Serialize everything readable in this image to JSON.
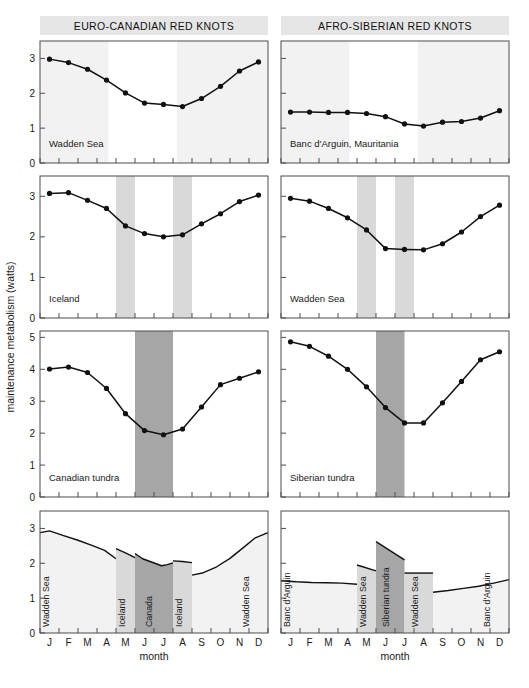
{
  "figure": {
    "y_axis_title": "maintenance metabolism (watts)",
    "x_axis_title": "month",
    "months": [
      "J",
      "F",
      "M",
      "A",
      "M",
      "J",
      "J",
      "A",
      "S",
      "O",
      "N",
      "D"
    ],
    "colors": {
      "header_band": "#e6e6e6",
      "light_band": "#f2f2f2",
      "mid_band": "#d9d9d9",
      "dark_band": "#a6a6a6",
      "line": "#111111",
      "marker": "#111111",
      "axis": "#4d4d4d"
    }
  },
  "columns": [
    {
      "id": "euro-canadian",
      "title": "EURO-CANADIAN RED KNOTS"
    },
    {
      "id": "afro-siberian",
      "title": "AFRO-SIBERIAN RED KNOTS"
    }
  ],
  "chart_data": [
    {
      "id": "wadden-sea-euro",
      "type": "line",
      "column": "euro-canadian",
      "row": 1,
      "title": "Wadden Sea",
      "xlabel": "",
      "ylabel": "maintenance metabolism (watts)",
      "categories": [
        "J",
        "F",
        "M",
        "A",
        "M",
        "J",
        "J",
        "A",
        "S",
        "O",
        "N",
        "D"
      ],
      "values": [
        2.98,
        2.88,
        2.69,
        2.38,
        2.01,
        1.72,
        1.68,
        1.62,
        1.85,
        2.2,
        2.64,
        2.9
      ],
      "ylim": [
        0,
        3.5
      ],
      "yticks": [
        0,
        1,
        2,
        3
      ],
      "grid": false,
      "shaded_regions": [
        {
          "label": "Wadden Sea",
          "from": 1,
          "to": 4.6,
          "shade": "light"
        },
        {
          "label": "Wadden Sea",
          "from": 8.2,
          "to": 13,
          "shade": "light"
        }
      ]
    },
    {
      "id": "banc-darguin",
      "type": "line",
      "column": "afro-siberian",
      "row": 1,
      "title": "Banc d'Arguin, Mauritania",
      "xlabel": "",
      "ylabel": "",
      "categories": [
        "J",
        "F",
        "M",
        "A",
        "M",
        "J",
        "J",
        "A",
        "S",
        "O",
        "N",
        "D"
      ],
      "values": [
        1.46,
        1.46,
        1.45,
        1.45,
        1.42,
        1.33,
        1.12,
        1.06,
        1.17,
        1.19,
        1.29,
        1.5
      ],
      "ylim": [
        0,
        3.5
      ],
      "yticks": [
        0,
        1,
        2,
        3
      ],
      "grid": false,
      "shaded_regions": [
        {
          "label": "Banc d'Arguin",
          "from": 1,
          "to": 4.6,
          "shade": "light"
        },
        {
          "label": "Banc d'Arguin",
          "from": 8.2,
          "to": 13,
          "shade": "light"
        }
      ]
    },
    {
      "id": "iceland",
      "type": "line",
      "column": "euro-canadian",
      "row": 2,
      "title": "Iceland",
      "xlabel": "",
      "ylabel": "maintenance metabolism (watts)",
      "categories": [
        "J",
        "F",
        "M",
        "A",
        "M",
        "J",
        "J",
        "A",
        "S",
        "O",
        "N",
        "D"
      ],
      "values": [
        3.07,
        3.09,
        2.9,
        2.7,
        2.27,
        2.08,
        2.0,
        2.05,
        2.32,
        2.57,
        2.87,
        3.03
      ],
      "ylim": [
        0,
        3.5
      ],
      "yticks": [
        0,
        1,
        2,
        3
      ],
      "grid": false,
      "shaded_regions": [
        {
          "label": "Iceland",
          "from": 5,
          "to": 6,
          "shade": "mid"
        },
        {
          "label": "Iceland",
          "from": 8,
          "to": 9,
          "shade": "mid"
        }
      ]
    },
    {
      "id": "wadden-sea-afro",
      "type": "line",
      "column": "afro-siberian",
      "row": 2,
      "title": "Wadden Sea",
      "xlabel": "",
      "ylabel": "",
      "categories": [
        "J",
        "F",
        "M",
        "A",
        "M",
        "J",
        "J",
        "A",
        "S",
        "O",
        "N",
        "D"
      ],
      "values": [
        2.95,
        2.88,
        2.7,
        2.47,
        2.17,
        1.71,
        1.69,
        1.68,
        1.83,
        2.12,
        2.5,
        2.78
      ],
      "ylim": [
        0,
        3.5
      ],
      "yticks": [
        0,
        1,
        2,
        3
      ],
      "grid": false,
      "shaded_regions": [
        {
          "label": "Wadden Sea",
          "from": 5,
          "to": 6,
          "shade": "mid"
        },
        {
          "label": "Wadden Sea",
          "from": 7,
          "to": 8,
          "shade": "mid"
        }
      ]
    },
    {
      "id": "canadian-tundra",
      "type": "line",
      "column": "euro-canadian",
      "row": 3,
      "title": "Canadian tundra",
      "xlabel": "",
      "ylabel": "maintenance metabolism (watts)",
      "categories": [
        "J",
        "F",
        "M",
        "A",
        "M",
        "J",
        "J",
        "A",
        "S",
        "O",
        "N",
        "D"
      ],
      "values": [
        4.01,
        4.07,
        3.9,
        3.4,
        2.61,
        2.08,
        1.95,
        2.13,
        2.82,
        3.52,
        3.72,
        3.92
      ],
      "ylim": [
        0,
        5.2
      ],
      "yticks": [
        0,
        1,
        2,
        3,
        4,
        5
      ],
      "grid": false,
      "shaded_regions": [
        {
          "label": "Canada",
          "from": 6,
          "to": 8,
          "shade": "dark"
        }
      ]
    },
    {
      "id": "siberian-tundra",
      "type": "line",
      "column": "afro-siberian",
      "row": 3,
      "title": "Siberian tundra",
      "xlabel": "",
      "ylabel": "",
      "categories": [
        "J",
        "F",
        "M",
        "A",
        "M",
        "J",
        "J",
        "A",
        "S",
        "O",
        "N",
        "D"
      ],
      "values": [
        4.86,
        4.72,
        4.41,
        4.0,
        3.45,
        2.8,
        2.32,
        2.32,
        2.95,
        3.62,
        4.3,
        4.55
      ],
      "ylim": [
        0,
        5.2
      ],
      "yticks": [
        0,
        1,
        2,
        3,
        4,
        5
      ],
      "grid": false,
      "shaded_regions": [
        {
          "label": "Siberian tundra",
          "from": 6,
          "to": 7.5,
          "shade": "dark"
        }
      ]
    },
    {
      "id": "euro-canadian-annual",
      "type": "area",
      "column": "euro-canadian",
      "row": 4,
      "title": "",
      "xlabel": "month",
      "ylabel": "maintenance metabolism (watts)",
      "categories": [
        "J",
        "F",
        "M",
        "A",
        "M",
        "J",
        "J",
        "A",
        "S",
        "O",
        "N",
        "D"
      ],
      "ylim": [
        0,
        3.5
      ],
      "yticks": [
        0,
        1,
        2,
        3
      ],
      "grid": false,
      "segments": [
        {
          "label": "Wadden Sea",
          "shade": "light",
          "from": 1.0,
          "to": 5.0,
          "points": [
            [
              1.0,
              2.88
            ],
            [
              1.5,
              2.93
            ],
            [
              2.2,
              2.8
            ],
            [
              3.0,
              2.66
            ],
            [
              3.8,
              2.5
            ],
            [
              4.4,
              2.37
            ],
            [
              5.0,
              2.13
            ]
          ]
        },
        {
          "label": "Iceland",
          "shade": "mid",
          "from": 5.0,
          "to": 6.0,
          "points": [
            [
              5.0,
              2.42
            ],
            [
              5.5,
              2.3
            ],
            [
              6.0,
              2.16
            ]
          ]
        },
        {
          "label": "Canada",
          "shade": "dark",
          "from": 6.0,
          "to": 8.0,
          "points": [
            [
              6.0,
              2.28
            ],
            [
              6.4,
              2.13
            ],
            [
              6.9,
              2.03
            ],
            [
              7.4,
              1.93
            ],
            [
              7.7,
              1.96
            ],
            [
              8.0,
              2.01
            ]
          ]
        },
        {
          "label": "Iceland",
          "shade": "mid",
          "from": 8.0,
          "to": 9.0,
          "points": [
            [
              8.0,
              2.07
            ],
            [
              8.5,
              2.05
            ],
            [
              9.0,
              2.02
            ]
          ]
        },
        {
          "label": "Wadden Sea",
          "shade": "light",
          "from": 9.0,
          "to": 13.0,
          "points": [
            [
              9.0,
              1.66
            ],
            [
              9.6,
              1.73
            ],
            [
              10.3,
              1.9
            ],
            [
              11.0,
              2.14
            ],
            [
              11.7,
              2.45
            ],
            [
              12.3,
              2.72
            ],
            [
              13.0,
              2.88
            ]
          ]
        }
      ],
      "region_labels": [
        {
          "text": "Wadden Sea",
          "at": 1.45
        },
        {
          "text": "Iceland",
          "at": 5.45
        },
        {
          "text": "Canada",
          "at": 6.9
        },
        {
          "text": "Iceland",
          "at": 8.45
        },
        {
          "text": "Wadden Sea",
          "at": 12.0
        }
      ]
    },
    {
      "id": "afro-siberian-annual",
      "type": "area",
      "column": "afro-siberian",
      "row": 4,
      "title": "",
      "xlabel": "month",
      "ylabel": "",
      "categories": [
        "J",
        "F",
        "M",
        "A",
        "M",
        "J",
        "J",
        "A",
        "S",
        "O",
        "N",
        "D"
      ],
      "ylim": [
        0,
        3.5
      ],
      "yticks": [
        0,
        1,
        2,
        3
      ],
      "grid": false,
      "segments": [
        {
          "label": "Banc d'Arguin",
          "shade": "light",
          "from": 1.0,
          "to": 5.0,
          "points": [
            [
              1.0,
              1.5
            ],
            [
              1.8,
              1.47
            ],
            [
              2.6,
              1.45
            ],
            [
              3.4,
              1.44
            ],
            [
              4.2,
              1.43
            ],
            [
              5.0,
              1.4
            ]
          ]
        },
        {
          "label": "Wadden Sea",
          "shade": "mid",
          "from": 5.0,
          "to": 6.0,
          "points": [
            [
              5.0,
              1.95
            ],
            [
              6.0,
              1.78
            ]
          ]
        },
        {
          "label": "Siberian tundra",
          "shade": "dark",
          "from": 6.0,
          "to": 7.5,
          "points": [
            [
              6.0,
              2.62
            ],
            [
              7.5,
              2.1
            ]
          ]
        },
        {
          "label": "Wadden Sea",
          "shade": "mid",
          "from": 7.5,
          "to": 9.0,
          "points": [
            [
              7.5,
              1.72
            ],
            [
              9.0,
              1.72
            ]
          ]
        },
        {
          "label": "Banc d'Arguin",
          "shade": "light",
          "from": 9.0,
          "to": 13.0,
          "points": [
            [
              9.0,
              1.17
            ],
            [
              9.8,
              1.22
            ],
            [
              10.6,
              1.28
            ],
            [
              11.4,
              1.34
            ],
            [
              12.2,
              1.43
            ],
            [
              13.0,
              1.53
            ]
          ]
        }
      ],
      "region_labels": [
        {
          "text": "Banc d'Arguin",
          "at": 1.45
        },
        {
          "text": "Wadden Sea",
          "at": 5.45
        },
        {
          "text": "Siberian tundra",
          "at": 6.7
        },
        {
          "text": "Wadden Sea",
          "at": 8.2
        },
        {
          "text": "Banc d'Arguin",
          "at": 12.0
        }
      ]
    }
  ]
}
